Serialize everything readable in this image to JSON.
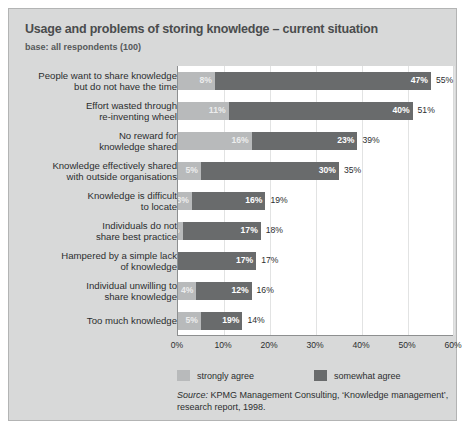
{
  "chart_data": {
    "type": "bar",
    "orientation": "horizontal",
    "stacked": true,
    "title": "Usage and problems of storing knowledge – current situation",
    "subtitle": "base: all respondents (100)",
    "xlabel": "",
    "ylabel": "",
    "xlim": [
      0,
      60
    ],
    "xticks": [
      0,
      10,
      20,
      30,
      40,
      50,
      60
    ],
    "xtick_labels": [
      "0%",
      "10%",
      "20%",
      "30%",
      "40%",
      "50%",
      "60%"
    ],
    "grid": true,
    "legend_position": "bottom",
    "categories": [
      "People want to share knowledge\nbut do not have the time",
      "Effort wasted through\nre-inventing wheel",
      "No reward for\nknowledge shared",
      "Knowledge effectively shared\nwith outside organisations",
      "Knowledge is difficult\nto locate",
      "Individuals do not\nshare best practice",
      "Hampered by a simple lack\nof knowledge",
      "Individual unwilling to\nshare knowledge",
      "Too much knowledge"
    ],
    "series": [
      {
        "name": "strongly agree",
        "color": "#b8babb",
        "values": [
          8,
          11,
          16,
          5,
          3,
          1,
          0,
          4,
          5
        ],
        "labels": [
          "8%",
          "11%",
          "16%",
          "5%",
          "3%",
          "1%",
          "",
          "4%",
          "5%"
        ]
      },
      {
        "name": "somewhat agree",
        "color": "#696b6c",
        "values": [
          47,
          40,
          23,
          30,
          16,
          17,
          17,
          12,
          9
        ],
        "labels": [
          "47%",
          "40%",
          "23%",
          "30%",
          "16%",
          "17%",
          "17%",
          "12%",
          "19%"
        ]
      }
    ],
    "totals": [
      55,
      51,
      39,
      35,
      19,
      18,
      17,
      16,
      14
    ],
    "total_labels": [
      "55%",
      "51%",
      "39%",
      "35%",
      "19%",
      "18%",
      "17%",
      "16%",
      "14%"
    ],
    "source": {
      "prefix": "Source:",
      "text": " KPMG Management Consulting, ‘Knowledge management’, research report, 1998."
    }
  },
  "legend": {
    "items": [
      {
        "label": "strongly agree",
        "color": "#b8babb"
      },
      {
        "label": "somewhat agree",
        "color": "#696b6c"
      }
    ]
  },
  "rows": [
    {
      "label_line1": "People want to share knowledge",
      "label_line2": "but do not have the time"
    },
    {
      "label_line1": "Effort wasted through",
      "label_line2": "re-inventing wheel"
    },
    {
      "label_line1": "No reward for",
      "label_line2": "knowledge shared"
    },
    {
      "label_line1": "Knowledge effectively shared",
      "label_line2": "with outside organisations"
    },
    {
      "label_line1": "Knowledge is difficult",
      "label_line2": "to locate"
    },
    {
      "label_line1": "Individuals do not",
      "label_line2": "share best practice"
    },
    {
      "label_line1": "Hampered by a simple lack",
      "label_line2": "of knowledge"
    },
    {
      "label_line1": "Individual unwilling to",
      "label_line2": "share knowledge"
    },
    {
      "label_line1": "Too much knowledge",
      "label_line2": ""
    }
  ]
}
